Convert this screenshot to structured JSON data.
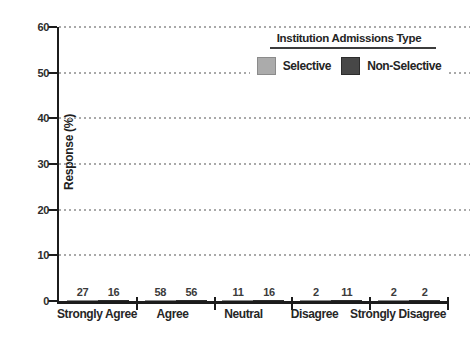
{
  "chart_data": {
    "type": "bar",
    "categories": [
      "Strongly Agree",
      "Agree",
      "Neutral",
      "Disagree",
      "Strongly Disagree"
    ],
    "series": [
      {
        "name": "Selective",
        "color": "#ababab",
        "values": [
          27,
          58,
          11,
          2,
          2
        ]
      },
      {
        "name": "Non-Selective",
        "color": "#474747",
        "values": [
          16,
          56,
          16,
          11,
          2
        ]
      }
    ],
    "title": "",
    "xlabel": "",
    "ylabel": "Response (%)",
    "ylim": [
      0,
      60
    ],
    "yticks": [
      0,
      10,
      20,
      30,
      40,
      50,
      60
    ],
    "grid": "horizontal-dotted",
    "legend_title": "Institution Admissions Type",
    "legend_position": "top-right-inside",
    "colors": {
      "axis": "#1c1c1c",
      "gridline": "#a9a9a9",
      "text": "#2d2d2d",
      "background": "#ffffff"
    }
  }
}
